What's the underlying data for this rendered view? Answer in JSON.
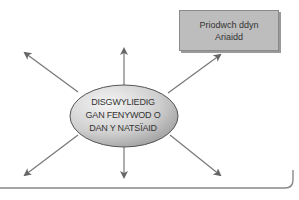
{
  "diagram": {
    "type": "spider-diagram",
    "center": {
      "lines": [
        "DISGWYLIEDIG",
        "GAN FENYWOD O",
        "DAN Y NATSÏAID"
      ]
    },
    "boxes": [
      {
        "position": "top-right",
        "lines": [
          "Priodwch ddyn",
          "Ariaidd"
        ]
      }
    ],
    "arrows": [
      "up-left",
      "up",
      "up-right",
      "down-left",
      "down",
      "down-right"
    ],
    "colors": {
      "ellipse_fill_light": "#f2f2f2",
      "ellipse_fill_dark": "#9a9a9a",
      "box_fill": "#bdbdbd",
      "arrow": "#666666",
      "frame": "#888888"
    }
  }
}
